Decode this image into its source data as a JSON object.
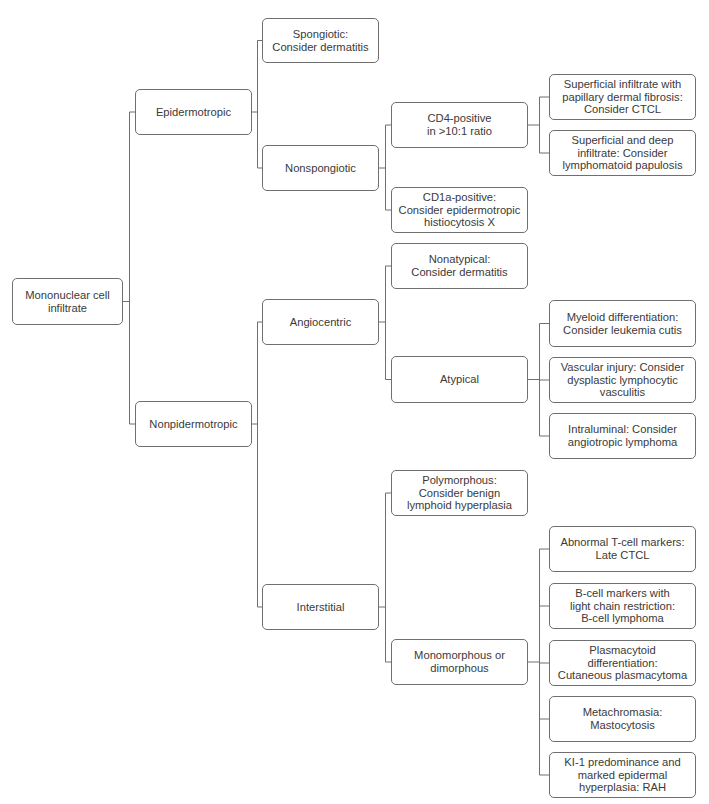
{
  "diagram": {
    "type": "decision-tree",
    "line_color": "#6f6f6f",
    "box_border_color": "#6f6f6f",
    "text_color": "#3a3a3a",
    "nodes": [
      {
        "id": "root",
        "label": "Mononuclear cell\ninfiltrate",
        "x": 12,
        "y": 278,
        "w": 111,
        "h": 47
      },
      {
        "id": "epidermotropic",
        "label": "Epidermotropic",
        "x": 135,
        "y": 89,
        "w": 117,
        "h": 46,
        "parent": "root"
      },
      {
        "id": "nonpidermotropic",
        "label": "Nonpidermotropic",
        "x": 135,
        "y": 401,
        "w": 117,
        "h": 46,
        "parent": "root"
      },
      {
        "id": "spongiotic",
        "label": "Spongiotic:\nConsider dermatitis",
        "x": 262,
        "y": 18,
        "w": 117,
        "h": 45,
        "parent": "epidermotropic"
      },
      {
        "id": "nonspongiotic",
        "label": "Nonspongiotic",
        "x": 262,
        "y": 145,
        "w": 117,
        "h": 46,
        "parent": "epidermotropic"
      },
      {
        "id": "angiocentric",
        "label": "Angiocentric",
        "x": 262,
        "y": 299,
        "w": 117,
        "h": 46,
        "parent": "nonpidermotropic"
      },
      {
        "id": "interstitial",
        "label": "Interstitial",
        "x": 262,
        "y": 584,
        "w": 117,
        "h": 46,
        "parent": "nonpidermotropic"
      },
      {
        "id": "cd4",
        "label": "CD4-positive\nin >10:1 ratio",
        "x": 391,
        "y": 102,
        "w": 137,
        "h": 46,
        "parent": "nonspongiotic"
      },
      {
        "id": "cd1a",
        "label": "CD1a-positive:\nConsider epidermotropic\nhistiocytosis X",
        "x": 391,
        "y": 187,
        "w": 137,
        "h": 46,
        "parent": "nonspongiotic"
      },
      {
        "id": "nonatypical",
        "label": "Nonatypical:\nConsider dermatitis",
        "x": 391,
        "y": 243,
        "w": 137,
        "h": 46,
        "parent": "angiocentric"
      },
      {
        "id": "atypical",
        "label": "Atypical",
        "x": 391,
        "y": 356,
        "w": 137,
        "h": 47,
        "parent": "angiocentric"
      },
      {
        "id": "polymorphous",
        "label": "Polymorphous:\nConsider benign\nlymphoid hyperplasia",
        "x": 391,
        "y": 470,
        "w": 137,
        "h": 46,
        "parent": "interstitial"
      },
      {
        "id": "monomorphous",
        "label": "Monomorphous or\ndimorphous",
        "x": 391,
        "y": 639,
        "w": 137,
        "h": 46,
        "parent": "interstitial"
      },
      {
        "id": "superficial",
        "label": "Superficial infiltrate with\npapillary dermal fibrosis:\nConsider CTCL",
        "x": 549,
        "y": 74,
        "w": 147,
        "h": 46,
        "parent": "cd4"
      },
      {
        "id": "superficial-deep",
        "label": "Superficial and deep\ninfiltrate: Consider\nlymphomatoid papulosis",
        "x": 549,
        "y": 130,
        "w": 147,
        "h": 46,
        "parent": "cd4"
      },
      {
        "id": "myeloid",
        "label": "Myeloid differentiation:\nConsider leukemia cutis",
        "x": 549,
        "y": 300,
        "w": 147,
        "h": 47,
        "parent": "atypical"
      },
      {
        "id": "vascular",
        "label": "Vascular injury: Consider\ndysplastic lymphocytic\nvasculitis",
        "x": 549,
        "y": 357,
        "w": 147,
        "h": 46,
        "parent": "atypical"
      },
      {
        "id": "intraluminal",
        "label": "Intraluminal: Consider\nangiotropic lymphoma",
        "x": 549,
        "y": 413,
        "w": 147,
        "h": 46,
        "parent": "atypical"
      },
      {
        "id": "abnormal-t",
        "label": "Abnormal T-cell markers:\nLate CTCL",
        "x": 549,
        "y": 526,
        "w": 147,
        "h": 46,
        "parent": "monomorphous"
      },
      {
        "id": "b-cell",
        "label": "B-cell markers with\nlight chain restriction:\nB-cell lymphoma",
        "x": 549,
        "y": 583,
        "w": 147,
        "h": 46,
        "parent": "monomorphous"
      },
      {
        "id": "plasmacytoid",
        "label": "Plasmacytoid differentiation:\nCutaneous plasmacytoma",
        "x": 549,
        "y": 640,
        "w": 147,
        "h": 46,
        "parent": "monomorphous"
      },
      {
        "id": "metachromasia",
        "label": "Metachromasia:\nMastocytosis",
        "x": 549,
        "y": 696,
        "w": 147,
        "h": 46,
        "parent": "monomorphous"
      },
      {
        "id": "ki1",
        "label": "KI-1 predominance and\nmarked epidermal\nhyperplasia: RAH",
        "x": 549,
        "y": 752,
        "w": 147,
        "h": 46,
        "parent": "monomorphous"
      }
    ]
  }
}
